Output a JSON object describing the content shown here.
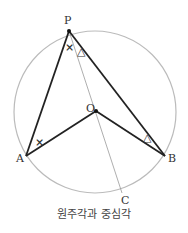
{
  "diagram": {
    "title": "원주각과 중심각",
    "points": {
      "P": {
        "label": "P",
        "x": 69,
        "y": 31
      },
      "A": {
        "label": "A",
        "x": 26,
        "y": 156
      },
      "B": {
        "label": "B",
        "x": 165,
        "y": 156
      },
      "O": {
        "label": "O",
        "x": 96,
        "y": 111
      },
      "C": {
        "label": "C",
        "x": 122,
        "y": 193
      }
    },
    "circle": {
      "cx": 95,
      "cy": 112,
      "r": 81,
      "color": "#bbbbbb"
    },
    "segments": [
      "PA",
      "PB",
      "OA",
      "OB",
      "PC"
    ],
    "angle_marks": [
      {
        "at": "P (APO)",
        "symbol": "×"
      },
      {
        "at": "A (PAO)",
        "symbol": "×"
      },
      {
        "at": "P (OPB)",
        "symbol": "△"
      },
      {
        "at": "B (PBO)",
        "symbol": "△"
      }
    ],
    "colors": {
      "lines": "#222222",
      "thin_line": "#999999",
      "circle": "#bbbbbb"
    }
  }
}
